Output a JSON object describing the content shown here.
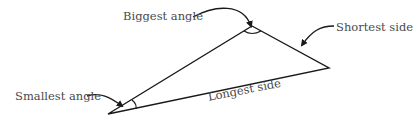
{
  "diagram": {
    "vertices": {
      "top": [
        252,
        26
      ],
      "bottom_left": [
        108,
        114
      ],
      "right": [
        329,
        68
      ]
    },
    "labels": {
      "biggest_angle": "Biggest angle",
      "shortest_side": "Shortest side",
      "smallest_angle": "Smallest angle",
      "longest_side": "Longest side"
    },
    "colors": {
      "stroke": "#1a1a1a",
      "text": "#4a4a4a"
    }
  }
}
